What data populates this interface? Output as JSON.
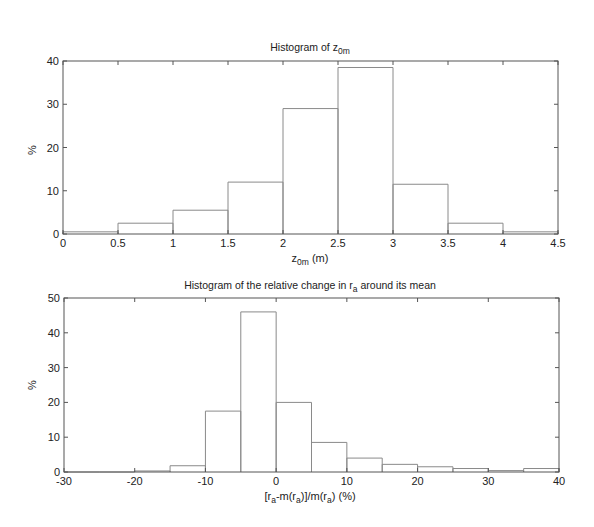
{
  "chart_data": [
    {
      "type": "bar",
      "title": "Histogram of z_0m",
      "title_main": "Histogram of z",
      "title_sub": "0m",
      "xlabel": "z_0m (m)",
      "xlabel_main": "z",
      "xlabel_sub": "0m",
      "xlabel_suffix": " (m)",
      "ylabel": "%",
      "xlim": [
        0,
        4.5
      ],
      "ylim": [
        0,
        40
      ],
      "xticks": [
        "0",
        "0.5",
        "1",
        "1.5",
        "2",
        "2.5",
        "3",
        "3.5",
        "4",
        "4.5"
      ],
      "yticks": [
        "0",
        "10",
        "20",
        "30",
        "40"
      ],
      "bin_edges": [
        0,
        0.5,
        1,
        1.5,
        2,
        2.5,
        3,
        3.5,
        4,
        4.5
      ],
      "values": [
        0.5,
        2.5,
        5.5,
        12,
        29,
        38.5,
        11.5,
        2.5,
        0.5
      ],
      "style": "stairs-outline",
      "grid": false
    },
    {
      "type": "bar",
      "title": "Histogram of the relative change in r_a around its mean",
      "title_main": "Histogram of the relative change in r",
      "title_sub": "a",
      "title_suffix": " around its mean",
      "xlabel": "[r_a-m(r_a)]/m(r_a) (%)",
      "ylabel": "%",
      "xlim": [
        -30,
        40
      ],
      "ylim": [
        0,
        50
      ],
      "xticks": [
        "-30",
        "-20",
        "-10",
        "0",
        "10",
        "20",
        "30",
        "40"
      ],
      "yticks": [
        "0",
        "10",
        "20",
        "30",
        "40",
        "50"
      ],
      "bin_edges": [
        -30,
        -25,
        -20,
        -15,
        -10,
        -5,
        0,
        5,
        10,
        15,
        20,
        25,
        30,
        35,
        40
      ],
      "values": [
        0,
        0,
        0.3,
        1.8,
        17.5,
        46,
        20,
        8.5,
        4,
        2.2,
        1.5,
        1.0,
        0.4,
        1.0
      ],
      "style": "stairs-outline",
      "grid": false
    }
  ],
  "colors": {
    "axes": "#555555",
    "series": "#8a8a8a",
    "text": "#222222"
  }
}
